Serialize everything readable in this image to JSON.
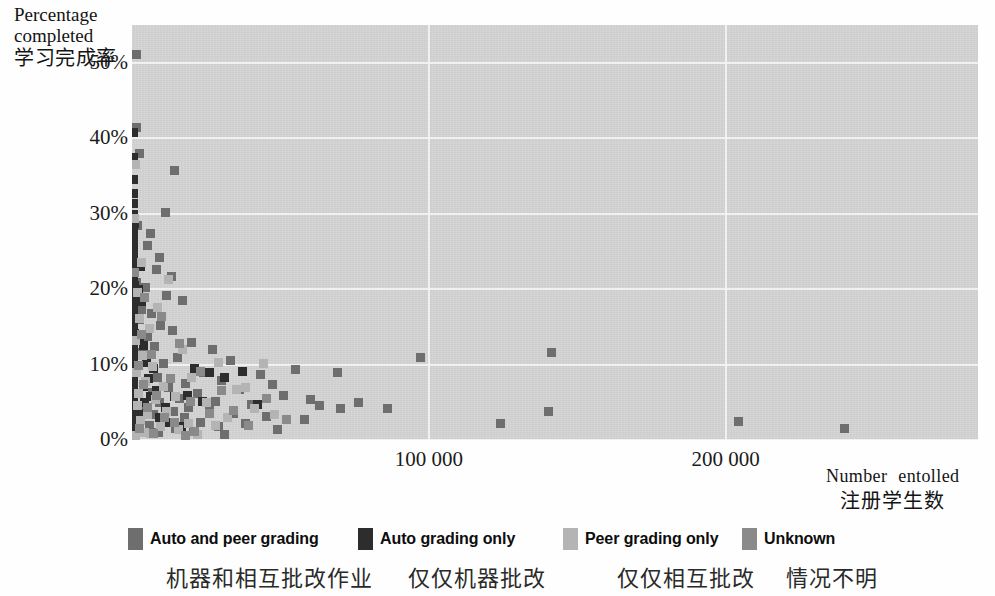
{
  "chart_data": {
    "type": "scatter",
    "title": "",
    "xlabel": "Number entolled",
    "xlabel_cn": "注册学生数",
    "ylabel": "Percentage completed",
    "ylabel_cn": "学习完成率",
    "xlim": [
      0,
      285000
    ],
    "ylim": [
      0,
      55
    ],
    "grid": true,
    "legend_position": "bottom",
    "x_ticks": [
      {
        "value": 100000,
        "label": "100 000"
      },
      {
        "value": 200000,
        "label": "200 000"
      }
    ],
    "y_ticks": [
      {
        "value": 0,
        "label": "0%"
      },
      {
        "value": 10,
        "label": "10%"
      },
      {
        "value": 20,
        "label": "20%"
      },
      {
        "value": 30,
        "label": "30%"
      },
      {
        "value": 40,
        "label": "40%"
      },
      {
        "value": 50,
        "label": "50%"
      }
    ],
    "series": [
      {
        "name": "Auto and peer grading",
        "name_cn": "机器和相互批改作业",
        "color": "#6e6e6e",
        "points": [
          [
            1500,
            51.2
          ],
          [
            1200,
            41.5
          ],
          [
            2500,
            38.0
          ],
          [
            14000,
            35.8
          ],
          [
            11000,
            30.2
          ],
          [
            1800,
            28.5
          ],
          [
            6000,
            27.4
          ],
          [
            5200,
            25.8
          ],
          [
            9000,
            24.2
          ],
          [
            8000,
            22.6
          ],
          [
            13000,
            21.8
          ],
          [
            1400,
            21.0
          ],
          [
            4500,
            20.3
          ],
          [
            11500,
            19.2
          ],
          [
            17000,
            18.6
          ],
          [
            3000,
            17.4
          ],
          [
            6500,
            16.8
          ],
          [
            2200,
            16.0
          ],
          [
            9500,
            15.2
          ],
          [
            13500,
            14.6
          ],
          [
            5000,
            13.8
          ],
          [
            20000,
            13.0
          ],
          [
            7500,
            12.4
          ],
          [
            27000,
            12.0
          ],
          [
            3500,
            11.6
          ],
          [
            15000,
            11.0
          ],
          [
            33000,
            10.6
          ],
          [
            10500,
            10.2
          ],
          [
            55000,
            9.4
          ],
          [
            24000,
            9.0
          ],
          [
            43000,
            8.8
          ],
          [
            8500,
            8.4
          ],
          [
            30000,
            8.0
          ],
          [
            18000,
            7.6
          ],
          [
            47000,
            7.4
          ],
          [
            12000,
            7.0
          ],
          [
            36000,
            6.8
          ],
          [
            6800,
            6.4
          ],
          [
            22000,
            6.2
          ],
          [
            51000,
            6.0
          ],
          [
            16000,
            5.6
          ],
          [
            60000,
            5.4
          ],
          [
            28000,
            5.2
          ],
          [
            9200,
            5.0
          ],
          [
            40000,
            4.8
          ],
          [
            4200,
            4.6
          ],
          [
            19000,
            4.4
          ],
          [
            70000,
            4.2
          ],
          [
            26000,
            4.0
          ],
          [
            13800,
            3.8
          ],
          [
            34000,
            3.6
          ],
          [
            7200,
            3.4
          ],
          [
            45000,
            3.2
          ],
          [
            17500,
            3.0
          ],
          [
            58000,
            2.8
          ],
          [
            10800,
            2.6
          ],
          [
            23000,
            2.4
          ],
          [
            38000,
            2.2
          ],
          [
            5800,
            2.0
          ],
          [
            29000,
            1.8
          ],
          [
            14500,
            1.6
          ],
          [
            49000,
            1.4
          ],
          [
            20500,
            1.2
          ],
          [
            8800,
            1.0
          ],
          [
            31000,
            0.8
          ],
          [
            141000,
            11.6
          ],
          [
            97000,
            11.0
          ],
          [
            69000,
            9.0
          ],
          [
            140000,
            3.8
          ],
          [
            204000,
            2.5
          ],
          [
            124000,
            2.2
          ],
          [
            240000,
            1.6
          ],
          [
            63000,
            4.6
          ],
          [
            76000,
            5.0
          ],
          [
            86000,
            4.2
          ]
        ]
      },
      {
        "name": "Auto grading only",
        "name_cn": "仅仅机器批改",
        "color": "#2d2d2d",
        "points": [
          [
            400,
            40.8
          ],
          [
            300,
            37.5
          ],
          [
            500,
            34.6
          ],
          [
            350,
            32.8
          ],
          [
            450,
            31.4
          ],
          [
            300,
            30.0
          ],
          [
            600,
            28.8
          ],
          [
            400,
            27.6
          ],
          [
            350,
            26.4
          ],
          [
            500,
            25.4
          ],
          [
            300,
            24.4
          ],
          [
            450,
            23.4
          ],
          [
            400,
            22.4
          ],
          [
            350,
            21.4
          ],
          [
            550,
            20.6
          ],
          [
            300,
            19.8
          ],
          [
            400,
            19.0
          ],
          [
            450,
            18.2
          ],
          [
            350,
            17.4
          ],
          [
            500,
            16.6
          ],
          [
            300,
            15.8
          ],
          [
            400,
            15.0
          ],
          [
            600,
            14.2
          ],
          [
            350,
            13.4
          ],
          [
            450,
            12.6
          ],
          [
            300,
            11.8
          ],
          [
            400,
            11.0
          ],
          [
            500,
            10.2
          ],
          [
            350,
            9.4
          ],
          [
            450,
            8.6
          ],
          [
            300,
            7.8
          ],
          [
            400,
            7.0
          ],
          [
            550,
            6.2
          ],
          [
            350,
            5.4
          ],
          [
            450,
            4.6
          ],
          [
            300,
            3.8
          ],
          [
            400,
            3.0
          ],
          [
            500,
            2.2
          ],
          [
            350,
            1.4
          ],
          [
            300,
            0.8
          ],
          [
            2600,
            23.0
          ],
          [
            2000,
            20.0
          ],
          [
            3200,
            18.4
          ],
          [
            2400,
            13.4
          ],
          [
            3800,
            12.6
          ],
          [
            4800,
            10.4
          ],
          [
            7000,
            9.6
          ],
          [
            5400,
            8.2
          ],
          [
            3600,
            7.2
          ],
          [
            8200,
            6.6
          ],
          [
            6200,
            5.8
          ],
          [
            4000,
            5.0
          ],
          [
            11000,
            4.4
          ],
          [
            2800,
            3.6
          ],
          [
            9000,
            3.0
          ],
          [
            14000,
            5.8
          ],
          [
            21000,
            9.6
          ],
          [
            26000,
            9.0
          ],
          [
            37000,
            9.2
          ],
          [
            31000,
            8.4
          ],
          [
            18500,
            6.0
          ],
          [
            23500,
            5.2
          ],
          [
            42000,
            4.8
          ],
          [
            12500,
            2.4
          ],
          [
            16500,
            1.8
          ]
        ]
      },
      {
        "name": "Peer grading only",
        "name_cn": "仅仅相互批改",
        "color": "#b4b4b4",
        "points": [
          [
            1000,
            36.6
          ],
          [
            700,
            29.4
          ],
          [
            3000,
            23.6
          ],
          [
            12000,
            21.4
          ],
          [
            1600,
            19.6
          ],
          [
            8500,
            17.6
          ],
          [
            2400,
            16.2
          ],
          [
            5600,
            14.8
          ],
          [
            900,
            13.2
          ],
          [
            17000,
            12.0
          ],
          [
            3400,
            11.2
          ],
          [
            29000,
            10.4
          ],
          [
            6800,
            9.8
          ],
          [
            1300,
            9.0
          ],
          [
            20000,
            8.4
          ],
          [
            4400,
            7.8
          ],
          [
            10500,
            7.2
          ],
          [
            35000,
            6.8
          ],
          [
            2100,
            6.2
          ],
          [
            14500,
            5.8
          ],
          [
            7800,
            5.4
          ],
          [
            25000,
            5.0
          ],
          [
            1800,
            4.6
          ],
          [
            41000,
            4.2
          ],
          [
            11500,
            3.8
          ],
          [
            5000,
            3.4
          ],
          [
            32000,
            3.0
          ],
          [
            2700,
            2.6
          ],
          [
            19000,
            2.2
          ],
          [
            9500,
            1.8
          ],
          [
            15500,
            1.4
          ],
          [
            3900,
            1.0
          ],
          [
            22000,
            0.8
          ],
          [
            44000,
            10.2
          ],
          [
            38000,
            7.0
          ],
          [
            28000,
            2.0
          ],
          [
            48000,
            3.4
          ],
          [
            1100,
            0.6
          ],
          [
            6000,
            0.9
          ]
        ]
      },
      {
        "name": "Unknown",
        "name_cn": "情况不明",
        "color": "#8a8a8a",
        "points": [
          [
            800,
            22.2
          ],
          [
            4000,
            19.0
          ],
          [
            9800,
            16.4
          ],
          [
            2900,
            14.0
          ],
          [
            16000,
            12.8
          ],
          [
            6400,
            11.4
          ],
          [
            1900,
            10.0
          ],
          [
            23000,
            9.2
          ],
          [
            12800,
            8.2
          ],
          [
            3700,
            7.4
          ],
          [
            30000,
            6.6
          ],
          [
            8000,
            6.0
          ],
          [
            19500,
            5.2
          ],
          [
            5200,
            4.4
          ],
          [
            26000,
            3.6
          ],
          [
            10800,
            3.0
          ],
          [
            14000,
            2.4
          ],
          [
            39000,
            2.0
          ],
          [
            2300,
            1.6
          ],
          [
            21000,
            1.2
          ],
          [
            7000,
            0.9
          ],
          [
            45000,
            5.6
          ],
          [
            52000,
            2.8
          ],
          [
            34000,
            4.0
          ],
          [
            17800,
            0.7
          ]
        ]
      }
    ]
  },
  "axes": {
    "y_title_line1": "Percentage",
    "y_title_line2": "completed",
    "y_title_cn": "学习完成率",
    "x_title_en": "Number  entolled",
    "x_title_cn": "注册学生数"
  },
  "legend": {
    "items": [
      {
        "label": "Auto and peer grading",
        "label_cn": "机器和相互批改作业",
        "color": "#6e6e6e"
      },
      {
        "label": "Auto grading only",
        "label_cn": "仅仅机器批改",
        "color": "#2d2d2d"
      },
      {
        "label": "Peer grading only",
        "label_cn": "仅仅相互批改",
        "color": "#b4b4b4"
      },
      {
        "label": "Unknown",
        "label_cn": "情况不明",
        "color": "#8a8a8a"
      }
    ]
  },
  "style": {
    "plot_background": "#d5d5d5",
    "gridline_color": "#f3f3f3",
    "page_background": "#fefefe"
  }
}
